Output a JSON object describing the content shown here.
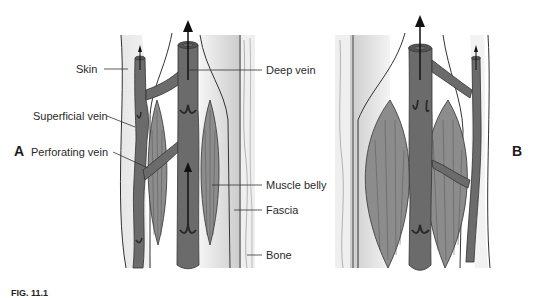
{
  "figure": {
    "panels": [
      {
        "id": "A",
        "label": "A"
      },
      {
        "id": "B",
        "label": "B"
      }
    ],
    "labels": {
      "skin": "Skin",
      "superficial_vein": "Superficial vein",
      "perforating_vein": "Perforating vein",
      "deep_vein": "Deep vein",
      "muscle_belly": "Muscle belly",
      "fascia": "Fascia",
      "bone": "Bone"
    },
    "caption": "FIG. 11.1"
  },
  "colors": {
    "vein": "#6b6b6b",
    "vein_dark": "#3a3a3a",
    "muscle": "#8a8a8a",
    "skin_band": "#d9d9d9",
    "bone_band": "#c8c8c8",
    "outline": "#333333",
    "background": "#ffffff"
  }
}
